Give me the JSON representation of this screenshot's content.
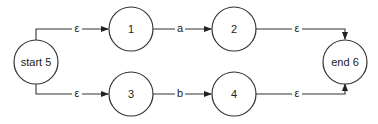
{
  "diagram": {
    "type": "NFA state diagram (union a|b)",
    "nodes": [
      {
        "id": "start",
        "label": "start 5"
      },
      {
        "id": "n1",
        "label": "1"
      },
      {
        "id": "n2",
        "label": "2"
      },
      {
        "id": "n3",
        "label": "3"
      },
      {
        "id": "n4",
        "label": "4"
      },
      {
        "id": "end",
        "label": "end 6"
      }
    ],
    "edges": [
      {
        "from": "start",
        "to": "n1",
        "label": "ε"
      },
      {
        "from": "n1",
        "to": "n2",
        "label": "a"
      },
      {
        "from": "n2",
        "to": "end",
        "label": "ε"
      },
      {
        "from": "start",
        "to": "n3",
        "label": "ε"
      },
      {
        "from": "n3",
        "to": "n4",
        "label": "b"
      },
      {
        "from": "n4",
        "to": "end",
        "label": "ε"
      }
    ]
  }
}
